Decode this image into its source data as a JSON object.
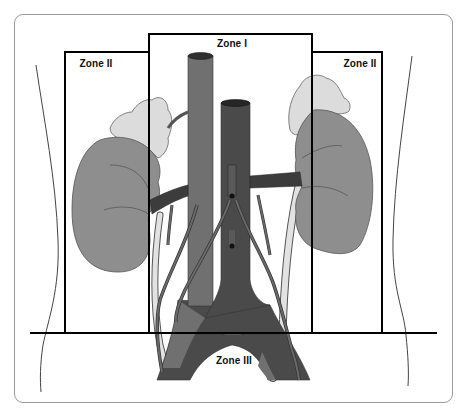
{
  "diagram": {
    "labels": {
      "zone_1": "Zone I",
      "zone_2_left": "Zone II",
      "zone_2_right": "Zone II",
      "zone_3": "Zone III"
    },
    "colors": {
      "background": "#ffffff",
      "frame_border": "#9a9a9a",
      "zone_lines": "#000000",
      "body_outline": "#444444",
      "kidney_fill": "#8e8e8e",
      "adrenal_fill": "#dcdcdc",
      "aorta_fill": "#707070",
      "ivc_fill": "#4a4a4a",
      "vessel_dark": "#3c3c3c",
      "ureter_fill": "#e2e2e2",
      "gonadal_vessel": "#6a6a6a"
    },
    "structures": [
      "body-outline",
      "zone-1-box",
      "zone-2-left-box",
      "zone-2-right-box",
      "pelvic-line",
      "left-kidney",
      "right-kidney",
      "left-adrenal",
      "right-adrenal",
      "aorta",
      "inferior-vena-cava",
      "renal-vessels",
      "ureters",
      "gonadal-vessels"
    ]
  }
}
